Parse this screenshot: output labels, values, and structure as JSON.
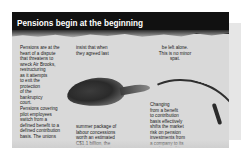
{
  "article": {
    "title": "Pensions begin at the beginning",
    "columns": [
      "Pensions are at the\nheart of a dispute\nthat threatens to\nwreck Air Brooks,\nrestructuring\nas it attempts\nto exit the\nprotection\nof the\nbankruptcy\ncourt.\nPensions covering\npilot employees\nswitch from a\ndefined benefit to a\ndefined contribution\nbasis. The unions",
      "insist that when\nthey agreed last",
      "summer package of\nlabour concessions\nworth an estimated\nC$1.1 billion, the\nquid pro quo was\nthat pensions would",
      "be left alone.\nThis is no minor\nspat.",
      "Changing\nfrom a benefit\nto contribution\nbasis effectively\nshifts the market\nrisk on pension\ninvestments from\na company to its\nemployees. Air\nBrooks's current"
    ]
  },
  "colors": {
    "header_bg": "#111111",
    "header_text": "#ffffff",
    "paper": "#d9d9d9",
    "body_text": "#1a1a1a"
  },
  "icons": {
    "illustration": "shoe-illustration",
    "decoration": "curved-arrow-icon"
  }
}
